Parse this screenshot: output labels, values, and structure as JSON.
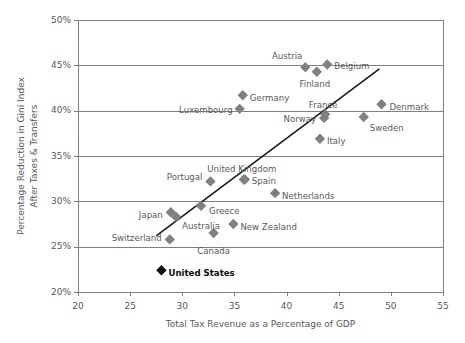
{
  "chart_data": {
    "type": "scatter",
    "title": "",
    "xlabel": "Total Tax Revenue as a Percentage of GDP",
    "ylabel": "Percentage Reduction in Gini Index After Taxes & Transfers",
    "ylabel_line1": "Percentage Reduction in Gini Index",
    "ylabel_line2": "After Taxes & Transfers",
    "xlim": [
      20,
      55
    ],
    "ylim": [
      20,
      50
    ],
    "xticks": [
      20,
      25,
      30,
      35,
      40,
      45,
      50,
      55
    ],
    "xtick_labels": [
      "20",
      "25",
      "30",
      "35",
      "40",
      "45",
      "50",
      "55"
    ],
    "yticks": [
      20,
      25,
      30,
      35,
      40,
      45,
      50
    ],
    "ytick_labels": [
      "20%",
      "25%",
      "30%",
      "35%",
      "40%",
      "45%",
      "50%"
    ],
    "grid": "horizontal",
    "legend": "none",
    "marker_shape": "diamond",
    "marker_color": "#808080",
    "highlight_color": "#0d0d0d",
    "points": [
      {
        "label": "Austria",
        "x": 41.8,
        "y": 44.8,
        "label_dx": -3,
        "label_dy": -11,
        "label_anchor": "end",
        "highlight": false
      },
      {
        "label": "Belgium",
        "x": 43.9,
        "y": 45.1,
        "label_dx": 7,
        "label_dy": 2,
        "label_anchor": "start",
        "highlight": false
      },
      {
        "label": "Finland",
        "x": 42.9,
        "y": 44.3,
        "label_dx": -2,
        "label_dy": 13,
        "label_anchor": "middle",
        "highlight": false
      },
      {
        "label": "Germany",
        "x": 35.8,
        "y": 41.7,
        "label_dx": 7,
        "label_dy": 3,
        "label_anchor": "start",
        "highlight": false
      },
      {
        "label": "Luxembourg",
        "x": 35.5,
        "y": 40.2,
        "label_dx": -7,
        "label_dy": 2,
        "label_anchor": "end",
        "highlight": false
      },
      {
        "label": "Denmark",
        "x": 49.1,
        "y": 40.7,
        "label_dx": 8,
        "label_dy": 3,
        "label_anchor": "start",
        "highlight": false
      },
      {
        "label": "France",
        "x": 43.7,
        "y": 39.6,
        "label_dx": -2,
        "label_dy": -9,
        "label_anchor": "middle",
        "highlight": false
      },
      {
        "label": "Norway",
        "x": 43.6,
        "y": 39.2,
        "label_dx": -8,
        "label_dy": 2,
        "label_anchor": "end",
        "highlight": false
      },
      {
        "label": "Sweden",
        "x": 47.4,
        "y": 39.3,
        "label_dx": 6,
        "label_dy": 11,
        "label_anchor": "start",
        "highlight": false
      },
      {
        "label": "Italy",
        "x": 43.2,
        "y": 36.9,
        "label_dx": 7,
        "label_dy": 3,
        "label_anchor": "start",
        "highlight": false
      },
      {
        "label": "United Kingdom",
        "x": 35.9,
        "y": 32.4,
        "label_dx": -2,
        "label_dy": -10,
        "label_anchor": "middle",
        "highlight": false
      },
      {
        "label": "Portugal",
        "x": 32.7,
        "y": 32.2,
        "label_dx": -8,
        "label_dy": -4,
        "label_anchor": "end",
        "highlight": false
      },
      {
        "label": "Spain",
        "x": 36.0,
        "y": 32.4,
        "label_dx": 7,
        "label_dy": 2,
        "label_anchor": "start",
        "highlight": false
      },
      {
        "label": "Netherlands",
        "x": 38.9,
        "y": 30.9,
        "label_dx": 7,
        "label_dy": 3,
        "label_anchor": "start",
        "highlight": false
      },
      {
        "label": "Greece",
        "x": 31.8,
        "y": 29.5,
        "label_dx": 8,
        "label_dy": 6,
        "label_anchor": "start",
        "highlight": false
      },
      {
        "label": "Japan",
        "x": 28.9,
        "y": 28.8,
        "label_dx": -8,
        "label_dy": 3,
        "label_anchor": "end",
        "highlight": false
      },
      {
        "label": "Australia",
        "x": 29.4,
        "y": 28.3,
        "label_dx": 6,
        "label_dy": 10,
        "label_anchor": "start",
        "highlight": false
      },
      {
        "label": "New Zealand",
        "x": 34.9,
        "y": 27.5,
        "label_dx": 7,
        "label_dy": 3,
        "label_anchor": "start",
        "highlight": false
      },
      {
        "label": "Canada",
        "x": 33.0,
        "y": 26.5,
        "label_dx": 0,
        "label_dy": 18,
        "label_anchor": "middle",
        "highlight": false
      },
      {
        "label": "Switzerland",
        "x": 28.8,
        "y": 25.8,
        "label_dx": -8,
        "label_dy": -1,
        "label_anchor": "end",
        "highlight": false
      },
      {
        "label": "United States",
        "x": 28.0,
        "y": 22.4,
        "label_dx": 7,
        "label_dy": 3,
        "label_anchor": "start",
        "highlight": true
      }
    ],
    "trendline": {
      "x1": 27.5,
      "y1": 26.2,
      "x2": 48.9,
      "y2": 44.6
    }
  }
}
